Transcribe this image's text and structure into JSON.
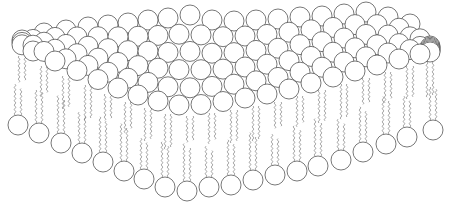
{
  "diagram": {
    "title": "",
    "background": "#ffffff",
    "stroke_color": "#555555",
    "head_radius": 10,
    "bottom_layer": {
      "description": "lower leaflet heads (front edge, V-shaped)",
      "heads": [
        [
          18,
          125
        ],
        [
          39,
          133
        ],
        [
          61,
          143
        ],
        [
          82,
          153
        ],
        [
          103,
          162
        ],
        [
          124,
          171
        ],
        [
          144,
          179
        ],
        [
          165,
          187
        ],
        [
          187,
          191
        ],
        [
          209,
          187
        ],
        [
          231,
          185
        ],
        [
          253,
          180
        ],
        [
          275,
          175
        ],
        [
          297,
          171
        ],
        [
          318,
          166
        ],
        [
          341,
          160
        ],
        [
          363,
          152
        ],
        [
          386,
          144
        ],
        [
          407,
          137
        ],
        [
          433,
          130
        ]
      ]
    },
    "top_layer": {
      "description": "upper leaflet heads packed in a perspective sheet",
      "front_edge": [
        [
          22,
          46
        ],
        [
          44,
          56
        ],
        [
          66,
          66
        ],
        [
          88,
          75
        ],
        [
          108,
          84
        ],
        [
          128,
          92
        ],
        [
          148,
          98
        ],
        [
          168,
          104
        ],
        [
          190,
          106
        ],
        [
          212,
          103
        ],
        [
          234,
          100
        ],
        [
          256,
          96
        ],
        [
          278,
          92
        ],
        [
          300,
          86
        ],
        [
          322,
          80
        ],
        [
          344,
          74
        ],
        [
          366,
          68
        ],
        [
          388,
          62
        ],
        [
          410,
          56
        ],
        [
          430,
          52
        ]
      ],
      "back_edge": [
        [
          22,
          40
        ],
        [
          44,
          33
        ],
        [
          66,
          30
        ],
        [
          88,
          27
        ],
        [
          108,
          25
        ],
        [
          128,
          23
        ],
        [
          148,
          20
        ],
        [
          168,
          18
        ],
        [
          190,
          15
        ],
        [
          212,
          20
        ],
        [
          234,
          21
        ],
        [
          256,
          20
        ],
        [
          278,
          19
        ],
        [
          300,
          17
        ],
        [
          322,
          16
        ],
        [
          344,
          14
        ],
        [
          366,
          12
        ],
        [
          388,
          17
        ],
        [
          410,
          24
        ],
        [
          430,
          46
        ]
      ],
      "rows": 5
    }
  }
}
